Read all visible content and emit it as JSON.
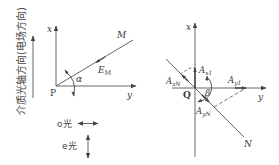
{
  "left_diagram": {
    "axis_label": "介质光轴方向(电场方向)",
    "x_label": "x",
    "y_label": "y",
    "origin_label": "P",
    "line_label": "M",
    "vector_label": "E",
    "vector_subscript": "M",
    "angle_label": "α",
    "legend": [
      {
        "label": "o光",
        "direction": "horizontal"
      },
      {
        "label": "e光",
        "direction": "vertical"
      }
    ]
  },
  "right_diagram": {
    "x_label": "x",
    "y_label": "y",
    "origin_label": "Q",
    "line_label": "N",
    "angle_label": "β",
    "components": [
      {
        "base": "A",
        "sub": "x1"
      },
      {
        "base": "A",
        "sub": "y1"
      },
      {
        "base": "A",
        "sub": "zN"
      },
      {
        "base": "A",
        "sub": "yN"
      }
    ]
  }
}
